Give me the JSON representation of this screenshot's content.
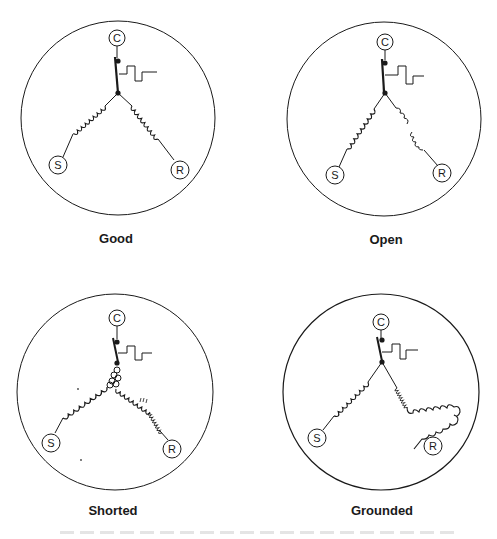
{
  "figure": {
    "colors": {
      "ink": "#1a1a1a",
      "background": "#ffffff"
    },
    "panels": [
      {
        "id": "good",
        "caption": "Good",
        "terminals": {
          "common": "C",
          "start": "S",
          "run": "R"
        },
        "condition": "Good"
      },
      {
        "id": "open",
        "caption": "Open",
        "terminals": {
          "common": "C",
          "start": "S",
          "run": "R"
        },
        "condition": "Open winding (break in run winding)"
      },
      {
        "id": "shorted",
        "caption": "Shorted",
        "terminals": {
          "common": "C",
          "start": "S",
          "run": "R"
        },
        "condition": "Shorted windings near junction"
      },
      {
        "id": "grounded",
        "caption": "Grounded",
        "terminals": {
          "common": "C",
          "start": "S",
          "run": "R"
        },
        "condition": "Run winding touching compressor shell"
      }
    ],
    "symbols": [
      "overload-protector",
      "winding-coil",
      "terminal"
    ]
  }
}
